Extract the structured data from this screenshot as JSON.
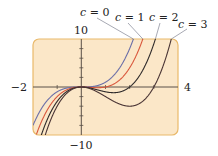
{
  "chart_data": {
    "type": "line",
    "title": "",
    "function": "f(x) = x^3 - c x^2",
    "xlabel": "",
    "ylabel": "",
    "xlim": [
      -2,
      4
    ],
    "ylim": [
      -10,
      10
    ],
    "grid": false,
    "x_tick_labels": [
      "-2",
      "4"
    ],
    "y_tick_labels": [
      "10",
      "-10"
    ],
    "x_tick_step": 1,
    "y_tick_step": 2,
    "legend_position": "inline labels above top-right",
    "series": [
      {
        "name": "c = 0",
        "c": 0,
        "color": "#6b6fa8",
        "x": [
          -2,
          -1.5,
          -1,
          -0.5,
          0,
          0.5,
          1,
          1.5,
          2,
          2.15
        ],
        "values": [
          -8,
          -3.375,
          -1,
          -0.125,
          0,
          0.125,
          1,
          3.375,
          8,
          9.94
        ]
      },
      {
        "name": "c = 1",
        "c": 1,
        "color": "#d9573c",
        "x": [
          -1.75,
          -1.5,
          -1,
          -0.5,
          0,
          0.5,
          1,
          1.5,
          2,
          2.5
        ],
        "values": [
          -8.42,
          -5.625,
          -2,
          -0.375,
          0,
          -0.125,
          0,
          1.125,
          4,
          9.375
        ]
      },
      {
        "name": "c = 2",
        "c": 2,
        "color": "#2e2a2a",
        "x": [
          -1.55,
          -1.5,
          -1,
          -0.5,
          0,
          0.5,
          1,
          1.333,
          2,
          2.5,
          3,
          3.1
        ],
        "values": [
          -8.53,
          -7.875,
          -3,
          -0.625,
          0,
          -0.375,
          -1,
          -1.185,
          0,
          3.125,
          9,
          10.58
        ]
      },
      {
        "name": "c = 3",
        "c": 3,
        "color": "#4a3535",
        "x": [
          -1.35,
          -1,
          -0.5,
          0,
          0.5,
          1,
          1.5,
          2,
          2.5,
          3,
          3.5,
          3.75
        ],
        "values": [
          -7.93,
          -4,
          -0.875,
          0,
          -0.625,
          -2,
          -3.375,
          -4,
          -3.125,
          0,
          6.125,
          10.55
        ]
      }
    ]
  },
  "labels": {
    "ymax": "10",
    "ymin": "−10",
    "xmin": "−2",
    "xmax": "4",
    "c0_var": "c",
    "c0_rest": " = 0",
    "c1_var": "c",
    "c1_rest": " = 1",
    "c2_var": "c",
    "c2_rest": " = 2",
    "c3_var": "c",
    "c3_rest": " = 3"
  },
  "colors": {
    "frame_fill": "#fbe7c8",
    "frame_stroke": "#e9b96a",
    "axis": "#5a5048"
  }
}
